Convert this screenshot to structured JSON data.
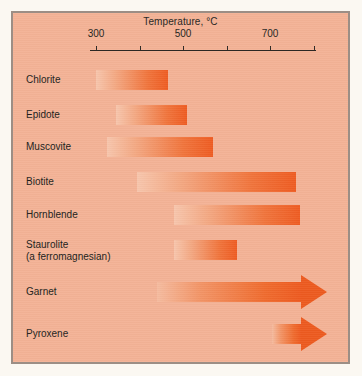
{
  "figure": {
    "panel_background": "#f3b295",
    "page_background": "#fbf8f2",
    "border_color": "#9c8e85",
    "bar_color_light": "#f7c5ac",
    "bar_color_dark": "#ee5c22"
  },
  "chart_data": {
    "type": "bar",
    "title": "Temperature, °C",
    "subtitle": "",
    "xlabel": "Temperature, °C",
    "ylabel": "",
    "orientation": "horizontal",
    "grid": false,
    "legend": "none",
    "xlim": [
      260,
      830
    ],
    "axis_ticks": [
      300,
      400,
      500,
      600,
      700,
      800
    ],
    "tick_labels_shown": [
      "300",
      "500",
      "700"
    ],
    "tick_labels_hidden": [
      "400",
      "600",
      "800"
    ],
    "categories": [
      "Chlorite",
      "Epidote",
      "Muscovite",
      "Biotite",
      "Hornblende",
      "Staurolite",
      "Garnet",
      "Pyroxene"
    ],
    "ranges": [
      {
        "name": "Chlorite",
        "start": 300,
        "end": 465,
        "open_ended": false
      },
      {
        "name": "Epidote",
        "start": 345,
        "end": 510,
        "open_ended": false
      },
      {
        "name": "Muscovite",
        "start": 325,
        "end": 570,
        "open_ended": false
      },
      {
        "name": "Biotite",
        "start": 395,
        "end": 760,
        "open_ended": false
      },
      {
        "name": "Hornblende",
        "start": 480,
        "end": 770,
        "open_ended": false
      },
      {
        "name": "Staurolite",
        "start": 480,
        "end": 625,
        "open_ended": false
      },
      {
        "name": "Garnet",
        "start": 440,
        "end": 830,
        "open_ended": true
      },
      {
        "name": "Pyroxene",
        "start": 705,
        "end": 830,
        "open_ended": true
      }
    ]
  },
  "axis": {
    "title": "Temperature, °C",
    "ticks": [
      {
        "value": "300",
        "label": "300",
        "show_label": true
      },
      {
        "value": "400",
        "label": "",
        "show_label": false
      },
      {
        "value": "500",
        "label": "500",
        "show_label": true
      },
      {
        "value": "600",
        "label": "",
        "show_label": false
      },
      {
        "value": "700",
        "label": "700",
        "show_label": true
      },
      {
        "value": "800",
        "label": "",
        "show_label": false
      }
    ]
  },
  "rows": [
    {
      "label": "Chlorite",
      "label2": "",
      "bar_type": "bar"
    },
    {
      "label": "Epidote",
      "label2": "",
      "bar_type": "bar"
    },
    {
      "label": "Muscovite",
      "label2": "",
      "bar_type": "bar"
    },
    {
      "label": "Biotite",
      "label2": "",
      "bar_type": "bar"
    },
    {
      "label": "Hornblende",
      "label2": "",
      "bar_type": "bar"
    },
    {
      "label": "Staurolite",
      "label2": "(a ferromagnesian)",
      "bar_type": "bar"
    },
    {
      "label": "Garnet",
      "label2": "",
      "bar_type": "arrow"
    },
    {
      "label": "Pyroxene",
      "label2": "",
      "bar_type": "arrow"
    }
  ]
}
